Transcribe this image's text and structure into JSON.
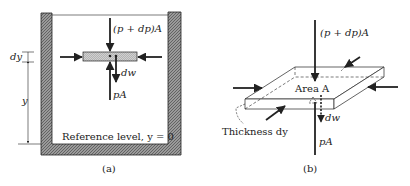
{
  "panel_a": {
    "caption": "(a)",
    "force_top": "(p + dp)A",
    "weight": "dw",
    "force_bottom": "pA",
    "dim_dy": "dy",
    "dim_y": "y",
    "reference": "Reference level, y = 0"
  },
  "panel_b": {
    "caption": "(b)",
    "force_top": "(p + dp)A",
    "area": "Area A",
    "weight": "dw",
    "force_bottom": "pA",
    "thickness": "Thickness dy"
  },
  "colors": {
    "stroke": "#222222",
    "wall_fill": "#8a8a8a",
    "element_fill": "#c8c8c8"
  }
}
